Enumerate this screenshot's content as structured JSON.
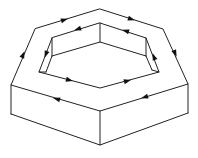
{
  "diagram": {
    "stroke_color": "#222222",
    "arrow_color": "#111111",
    "background": "#ffffff",
    "outer_top_hexagon": {
      "vertices": [
        [
          100,
          9
        ],
        [
          163,
          29
        ],
        [
          188,
          84
        ],
        [
          100,
          111
        ],
        [
          11,
          85
        ],
        [
          35,
          29
        ]
      ],
      "direction": "clockwise"
    },
    "outer_prism_bottom": {
      "vertices": [
        [
          11,
          114
        ],
        [
          100,
          145
        ],
        [
          188,
          113
        ]
      ]
    },
    "inner_hole_rim": {
      "vertices": [
        [
          100,
          23
        ],
        [
          146,
          38
        ],
        [
          159,
          72
        ],
        [
          100,
          88
        ],
        [
          39,
          72
        ],
        [
          52,
          38
        ]
      ],
      "direction": "counter-clockwise"
    },
    "inner_hole_floor_edges": [
      [
        [
          100,
          23
        ],
        [
          100,
          42
        ]
      ],
      [
        [
          100,
          42
        ],
        [
          146,
          56
        ]
      ],
      [
        [
          146,
          38
        ],
        [
          146,
          56
        ]
      ],
      [
        [
          52,
          38
        ],
        [
          46,
          72
        ]
      ],
      [
        [
          100,
          42
        ],
        [
          52,
          56
        ]
      ],
      [
        [
          52,
          38
        ],
        [
          52,
          56
        ]
      ]
    ],
    "arrows": [
      {
        "id": "outer-left",
        "at": [
          23,
          55
        ],
        "direction": "up"
      },
      {
        "id": "outer-top-left",
        "at": [
          64,
          20
        ],
        "direction": "up-right"
      },
      {
        "id": "outer-top-right",
        "at": [
          131,
          18
        ],
        "direction": "down-right"
      },
      {
        "id": "outer-right",
        "at": [
          174,
          52
        ],
        "direction": "down"
      },
      {
        "id": "outer-front-right",
        "at": [
          145,
          97
        ],
        "direction": "down-left"
      },
      {
        "id": "outer-front-left",
        "at": [
          58,
          99
        ],
        "direction": "up-left"
      },
      {
        "id": "inner-top-left",
        "at": [
          78,
          29
        ],
        "direction": "down-left"
      },
      {
        "id": "inner-left",
        "at": [
          47,
          53
        ],
        "direction": "down"
      },
      {
        "id": "inner-bottom-left",
        "at": [
          69,
          79
        ],
        "direction": "down-right"
      },
      {
        "id": "inner-bottom-right",
        "at": [
          126,
          80
        ],
        "direction": "up-right"
      },
      {
        "id": "inner-right",
        "at": [
          154,
          57
        ],
        "direction": "up"
      },
      {
        "id": "inner-top-right",
        "at": [
          127,
          32
        ],
        "direction": "up-left"
      }
    ]
  }
}
